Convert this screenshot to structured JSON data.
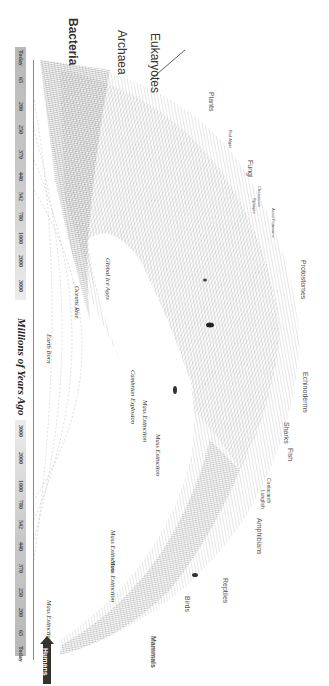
{
  "diagram": {
    "title": "Millions of Years Ago",
    "orientation": "rotated 90° clockwise",
    "domains": [
      "Bacteria",
      "Archaea",
      "Eukaryotes"
    ],
    "axis_top_ticks": [
      "Today",
      "65",
      "200",
      "250",
      "370",
      "440",
      "542",
      "780",
      "1000",
      "2000",
      "3000",
      "4000"
    ],
    "axis_bottom_ticks": [
      "4000",
      "3000",
      "2000",
      "1000",
      "780",
      "542",
      "440",
      "370",
      "250",
      "200",
      "65",
      "Today"
    ],
    "groups": [
      "Plants",
      "Red Algae",
      "Fungi",
      "Choanozoa",
      "Sponges",
      "Acoel Flatworms",
      "Protostomes",
      "Echinoderms",
      "Sharks",
      "Fish",
      "Coelacanth",
      "Lungfish",
      "Amphibians",
      "Reptiles",
      "Birds",
      "Mammals"
    ],
    "events": [
      "Global Ice Ages",
      "Oceans Rise",
      "Earth Born",
      "Cambrian Explosion",
      "Mass Extinction",
      "Mass Extinction",
      "Mass Extinction",
      "Mass Extinction",
      "Mass Extinction"
    ],
    "marker": "Humans",
    "colors": {
      "ink": "#333333",
      "axis_band": "#c8c8c8",
      "background": "#ffffff",
      "marker": "#333333"
    }
  }
}
